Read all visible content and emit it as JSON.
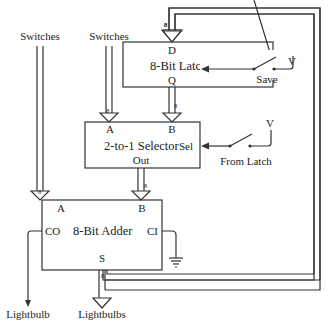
{
  "inputs": {
    "switches_a": "Switches",
    "switches_b": "Switches"
  },
  "latch": {
    "label": "8-Bit Latch",
    "input_d": "D",
    "output_q": "Q",
    "clock": "Clk",
    "switch_label": "Save",
    "voltage": "V"
  },
  "selector": {
    "label": "2-to-1 Selector",
    "input_a": "A",
    "input_b": "B",
    "select": "Sel",
    "output": "Out",
    "switch_label": "From Latch",
    "voltage": "V"
  },
  "adder": {
    "label": "8-Bit Adder",
    "input_a": "A",
    "input_b": "B",
    "carry_out": "CO",
    "carry_in": "CI",
    "sum": "S"
  },
  "outputs": {
    "lightbulb": "Lightbulb",
    "lightbulbs": "Lightbulbs"
  },
  "bus_width": "8"
}
